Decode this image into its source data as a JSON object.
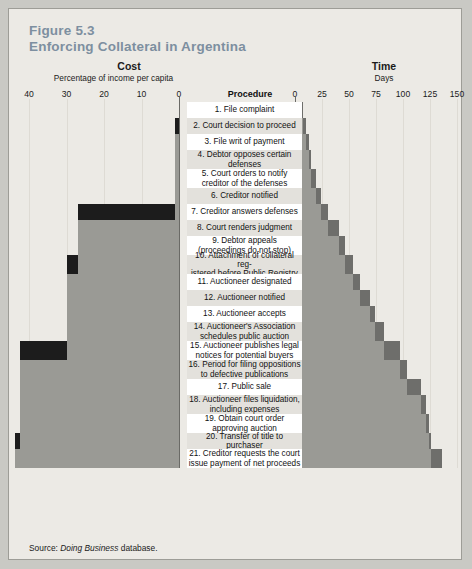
{
  "figure": {
    "number": "Figure 5.3",
    "title": "Enforcing Collateral in Argentina",
    "source_prefix": "Source: ",
    "source_italic": "Doing Business",
    "source_suffix": " database."
  },
  "colors": {
    "page_background": "#c9c9c4",
    "panel_background": "#eceae5",
    "panel_border": "#9d9d97",
    "title": "#7d8fa0",
    "row_odd": "#ffffff",
    "row_even": "#e3e1dc",
    "cost_cumulative": "#9a9a95",
    "cost_step": "#1c1c1c",
    "time_cumulative": "#9a9a95",
    "time_step": "#6e6e6b",
    "gridline": "#dedbd4",
    "axis": "#6a6a66"
  },
  "cost_panel": {
    "heading": "Cost",
    "subheading": "Percentage of income  per capita",
    "ticks": [
      "40",
      "30",
      "20",
      "10",
      "0"
    ],
    "axis_min": 0,
    "axis_max": 40,
    "direction": "right-to-left"
  },
  "time_panel": {
    "heading": "Time",
    "subheading": "Days",
    "ticks": [
      "0",
      "25",
      "50",
      "75",
      "100",
      "125",
      "150"
    ],
    "axis_min": 0,
    "axis_max": 150,
    "direction": "left-to-right"
  },
  "procedure_column": {
    "heading": "Procedure"
  },
  "chart_data": {
    "type": "bar",
    "title": "Enforcing Collateral in Argentina",
    "subtitle": "Figure 5.3",
    "categories": [
      "1. File complaint",
      "2. Court decision to proceed",
      "3. File writ of payment",
      "4. Debtor opposes certain defenses",
      "5. Court orders to notify creditor of the defenses",
      "6. Creditor notified",
      "7. Creditor answers defenses",
      "8. Court renders judgment",
      "9. Debtor appeals (proceedings do not stop)",
      "10. Attachment of collateral registered before Public Registry",
      "11. Auctioneer designated",
      "12. Auctioneer notified",
      "13. Auctioneer accepts",
      "14. Auctioneer's Association schedules public auction",
      "15. Auctioneer publishes legal notices for potential buyers",
      "16. Period for filing oppositions to defective publications",
      "17. Public sale",
      "18. Auctioneer files liquidation, including expenses",
      "19. Obtain court order approving auction",
      "20. Transfer of title to purchaser",
      "21. Creditor requests the court issue payment of net proceeds"
    ],
    "series": [
      {
        "name": "Cost step (% of income per capita)",
        "axis": "cost",
        "xlabel": "Percentage of income per capita",
        "values": [
          0,
          1.2,
          0,
          0,
          0,
          0,
          25.8,
          0,
          0,
          2.8,
          0,
          0,
          0,
          0,
          12.5,
          0,
          0,
          0,
          0,
          1.5,
          0
        ]
      },
      {
        "name": "Cost cumulative (% of income per capita)",
        "axis": "cost",
        "values": [
          0,
          1.2,
          1.2,
          1.2,
          1.2,
          1.2,
          27.0,
          27.0,
          27.0,
          29.8,
          29.8,
          29.8,
          29.8,
          29.8,
          42.3,
          42.3,
          42.3,
          42.3,
          42.3,
          43.8,
          43.8
        ]
      },
      {
        "name": "Time step (days)",
        "axis": "time",
        "xlabel": "Days",
        "values": [
          7,
          3,
          3,
          2,
          4,
          5,
          7,
          10,
          5,
          8,
          6,
          9,
          5,
          8,
          15,
          7,
          13,
          4,
          3,
          2,
          10
        ]
      },
      {
        "name": "Time cumulative (days)",
        "axis": "time",
        "values": [
          7,
          10,
          13,
          15,
          19,
          24,
          31,
          41,
          46,
          54,
          60,
          69,
          74,
          82,
          97,
          104,
          117,
          121,
          124,
          126,
          136
        ]
      }
    ],
    "cost_axis": {
      "ticks": [
        40,
        30,
        20,
        10,
        0
      ],
      "range": [
        0,
        40
      ],
      "grid": true,
      "label": "Percentage of income per capita"
    },
    "time_axis": {
      "ticks": [
        0,
        25,
        50,
        75,
        100,
        125,
        150
      ],
      "range": [
        0,
        150
      ],
      "grid": true,
      "label": "Days"
    },
    "legend": [],
    "rows": [
      {
        "n": 1,
        "label": "1. File complaint",
        "cost_step": 0,
        "cost_cum": 0,
        "time_step": 7,
        "time_cum": 7
      },
      {
        "n": 2,
        "label": "2. Court decision to proceed",
        "cost_step": 1.2,
        "cost_cum": 1.2,
        "time_step": 3,
        "time_cum": 10
      },
      {
        "n": 3,
        "label": "3. File writ of payment",
        "cost_step": 0,
        "cost_cum": 1.2,
        "time_step": 3,
        "time_cum": 13
      },
      {
        "n": 4,
        "label": "4. Debtor opposes certain defenses",
        "cost_step": 0,
        "cost_cum": 1.2,
        "time_step": 2,
        "time_cum": 15
      },
      {
        "n": 5,
        "label": "5. Court orders to notify creditor of the defenses",
        "cost_step": 0,
        "cost_cum": 1.2,
        "time_step": 4,
        "time_cum": 19
      },
      {
        "n": 6,
        "label": "6. Creditor notified",
        "cost_step": 0,
        "cost_cum": 1.2,
        "time_step": 5,
        "time_cum": 24
      },
      {
        "n": 7,
        "label": "7. Creditor answers defenses",
        "cost_step": 25.8,
        "cost_cum": 27.0,
        "time_step": 7,
        "time_cum": 31
      },
      {
        "n": 8,
        "label": "8. Court renders judgment",
        "cost_step": 0,
        "cost_cum": 27.0,
        "time_step": 10,
        "time_cum": 41
      },
      {
        "n": 9,
        "label": "9. Debtor appeals (proceedings do not stop)",
        "cost_step": 0,
        "cost_cum": 27.0,
        "time_step": 5,
        "time_cum": 46
      },
      {
        "n": 10,
        "label": "10. Attachment of collateral registered before Public Registry",
        "cost_step": 2.8,
        "cost_cum": 29.8,
        "time_step": 8,
        "time_cum": 54
      },
      {
        "n": 11,
        "label": "11. Auctioneer designated",
        "cost_step": 0,
        "cost_cum": 29.8,
        "time_step": 6,
        "time_cum": 60
      },
      {
        "n": 12,
        "label": "12. Auctioneer notified",
        "cost_step": 0,
        "cost_cum": 29.8,
        "time_step": 9,
        "time_cum": 69
      },
      {
        "n": 13,
        "label": "13. Auctioneer accepts",
        "cost_step": 0,
        "cost_cum": 29.8,
        "time_step": 5,
        "time_cum": 74
      },
      {
        "n": 14,
        "label": "14. Auctioneer's Association schedules public auction",
        "cost_step": 0,
        "cost_cum": 29.8,
        "time_step": 8,
        "time_cum": 82
      },
      {
        "n": 15,
        "label": "15. Auctioneer publishes legal notices for potential buyers",
        "cost_step": 12.5,
        "cost_cum": 42.3,
        "time_step": 15,
        "time_cum": 97
      },
      {
        "n": 16,
        "label": "16. Period for filing oppositions to defective publications",
        "cost_step": 0,
        "cost_cum": 42.3,
        "time_step": 7,
        "time_cum": 104
      },
      {
        "n": 17,
        "label": "17. Public sale",
        "cost_step": 0,
        "cost_cum": 42.3,
        "time_step": 13,
        "time_cum": 117
      },
      {
        "n": 18,
        "label": "18. Auctioneer files liquidation, including expenses",
        "cost_step": 0,
        "cost_cum": 42.3,
        "time_step": 4,
        "time_cum": 121
      },
      {
        "n": 19,
        "label": "19. Obtain court order approving auction",
        "cost_step": 0,
        "cost_cum": 42.3,
        "time_step": 3,
        "time_cum": 124
      },
      {
        "n": 20,
        "label": "20. Transfer of title to purchaser",
        "cost_step": 1.5,
        "cost_cum": 43.8,
        "time_step": 2,
        "time_cum": 126
      },
      {
        "n": 21,
        "label": "21. Creditor requests the court issue payment of net proceeds",
        "cost_step": 0,
        "cost_cum": 43.8,
        "time_step": 10,
        "time_cum": 136
      }
    ]
  },
  "procedure_lines": [
    [
      "1. File complaint"
    ],
    [
      "2. Court decision to proceed"
    ],
    [
      "3. File writ of payment"
    ],
    [
      "4. Debtor opposes certain",
      "defenses"
    ],
    [
      "5. Court orders to notify",
      "creditor of the defenses"
    ],
    [
      "6. Creditor notified"
    ],
    [
      "7. Creditor answers defenses"
    ],
    [
      "8. Court renders judgment"
    ],
    [
      "9. Debtor appeals",
      "(proceedings do not stop)"
    ],
    [
      "10. Attachment of collateral reg-",
      "istered before Public Registry"
    ],
    [
      "11. Auctioneer designated"
    ],
    [
      "12. Auctioneer notified"
    ],
    [
      "13. Auctioneer accepts"
    ],
    [
      "14. Auctioneer's Association",
      "schedules public auction"
    ],
    [
      "15. Auctioneer publishes legal",
      "notices for potential buyers"
    ],
    [
      "16. Period for filing oppositions",
      "to defective publications"
    ],
    [
      "17. Public sale"
    ],
    [
      "18. Auctioneer files liquidation,",
      "including expenses"
    ],
    [
      "19. Obtain court order",
      "approving auction"
    ],
    [
      "20. Transfer of title to purchaser"
    ],
    [
      "21. Creditor requests the court",
      "issue payment of net proceeds"
    ]
  ]
}
